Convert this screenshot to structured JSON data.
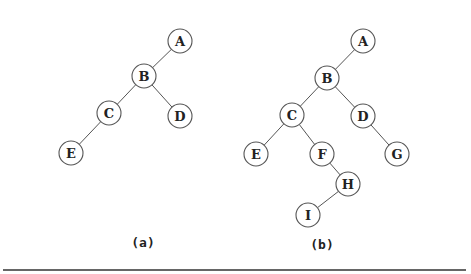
{
  "figure": {
    "colors": {
      "background": "#ffffff",
      "stroke": "#555555",
      "text": "#222222",
      "rule": "#333333"
    },
    "rules": {
      "top": {
        "x1": 90,
        "x2": 468,
        "y": 1
      },
      "bottom": {
        "x1": 3,
        "x2": 466,
        "y": 270
      }
    },
    "node_radius": 12,
    "trees": [
      {
        "id": "a",
        "caption": "(a)",
        "caption_pos": {
          "x": 143,
          "y": 247
        },
        "nodes": [
          {
            "label": "A",
            "x": 180,
            "y": 41
          },
          {
            "label": "B",
            "x": 144,
            "y": 76
          },
          {
            "label": "C",
            "x": 109,
            "y": 113
          },
          {
            "label": "D",
            "x": 180,
            "y": 116
          },
          {
            "label": "E",
            "x": 71,
            "y": 153
          }
        ],
        "edges": [
          [
            "A",
            "B"
          ],
          [
            "B",
            "C"
          ],
          [
            "B",
            "D"
          ],
          [
            "C",
            "E"
          ]
        ]
      },
      {
        "id": "b",
        "caption": "(b)",
        "caption_pos": {
          "x": 322,
          "y": 249
        },
        "nodes": [
          {
            "label": "A",
            "x": 363,
            "y": 41
          },
          {
            "label": "B",
            "x": 327,
            "y": 78
          },
          {
            "label": "C",
            "x": 292,
            "y": 115
          },
          {
            "label": "D",
            "x": 363,
            "y": 116
          },
          {
            "label": "E",
            "x": 256,
            "y": 154
          },
          {
            "label": "F",
            "x": 322,
            "y": 154
          },
          {
            "label": "G",
            "x": 397,
            "y": 154
          },
          {
            "label": "H",
            "x": 348,
            "y": 184
          },
          {
            "label": "I",
            "x": 308,
            "y": 215
          }
        ],
        "edges": [
          [
            "A",
            "B"
          ],
          [
            "B",
            "C"
          ],
          [
            "B",
            "D"
          ],
          [
            "C",
            "E"
          ],
          [
            "C",
            "F"
          ],
          [
            "D",
            "G"
          ],
          [
            "F",
            "H"
          ],
          [
            "H",
            "I"
          ]
        ]
      }
    ]
  }
}
